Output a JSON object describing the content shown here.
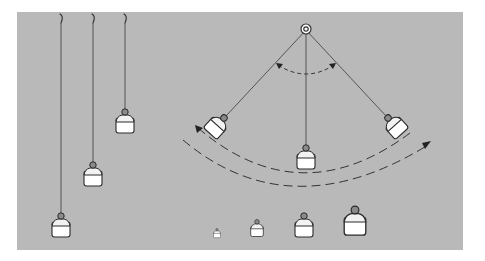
{
  "figure": {
    "title": "Pendulum illustration: effect of string length and bob mass on swing",
    "colors": {
      "background": "#ffffff",
      "panel": "#b9b9b9",
      "line": "#333333",
      "bob_fill": "#ffffff"
    },
    "panel": {
      "x": 17,
      "y": 12,
      "width": 446,
      "height": 238
    },
    "hanging_pendulums": [
      {
        "name": "long-pendulum",
        "hook_x": 62,
        "bob_y": 228
      },
      {
        "name": "medium-pendulum",
        "hook_x": 94,
        "bob_y": 177
      },
      {
        "name": "short-pendulum",
        "hook_x": 125,
        "bob_y": 124
      }
    ],
    "swinging_pendulum": {
      "pivot": {
        "x": 306,
        "y": 7
      },
      "positions": [
        "left-extreme",
        "center-rest",
        "right-extreme"
      ],
      "angle_arc": "double-headed dashed arc near pivot",
      "swing_arcs": "two dashed arcs beneath the bobs, one arrow at each end"
    },
    "weight_row": {
      "label": "bobs of increasing mass",
      "sizes": [
        "tiny",
        "small",
        "medium",
        "large"
      ]
    }
  }
}
